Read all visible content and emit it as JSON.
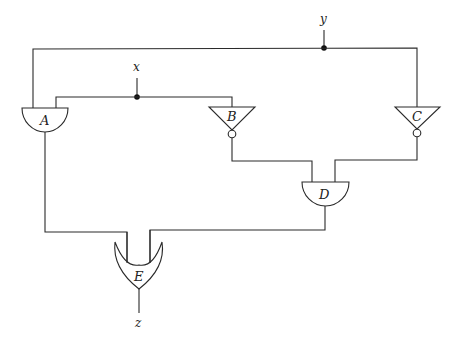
{
  "diagram": {
    "type": "logic-circuit",
    "inputs": [
      {
        "id": "x",
        "label": "x"
      },
      {
        "id": "y",
        "label": "y"
      }
    ],
    "output": {
      "id": "z",
      "label": "z"
    },
    "gates": [
      {
        "id": "A",
        "label": "A",
        "kind": "AND",
        "inputs": [
          "y",
          "x"
        ]
      },
      {
        "id": "B",
        "label": "B",
        "kind": "NOT",
        "inputs": [
          "x"
        ]
      },
      {
        "id": "C",
        "label": "C",
        "kind": "NOT",
        "inputs": [
          "y"
        ]
      },
      {
        "id": "D",
        "label": "D",
        "kind": "AND",
        "inputs": [
          "B",
          "C"
        ]
      },
      {
        "id": "E",
        "label": "E",
        "kind": "OR",
        "inputs": [
          "A",
          "D"
        ]
      }
    ],
    "colors": {
      "line": "#2a2a2a",
      "background": "#ffffff",
      "junction": "#111111"
    }
  }
}
